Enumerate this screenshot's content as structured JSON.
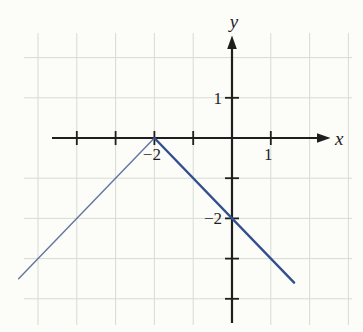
{
  "figure": {
    "background": "#fcfcf9",
    "grid_color": "#d7dcd0",
    "axis_color": "#1e1e1e",
    "label_color": "#1e1e1e",
    "x_axis_label": "x",
    "y_axis_label": "y",
    "x_ticks": [
      {
        "value": -4,
        "label": ""
      },
      {
        "value": -3,
        "label": ""
      },
      {
        "value": -2,
        "label": "−2"
      },
      {
        "value": -1,
        "label": ""
      },
      {
        "value": 1,
        "label": "1"
      }
    ],
    "y_ticks": [
      {
        "value": 1,
        "label": "1"
      },
      {
        "value": -1,
        "label": ""
      },
      {
        "value": -2,
        "label": "−2"
      },
      {
        "value": -3,
        "label": ""
      },
      {
        "value": -4,
        "label": ""
      }
    ],
    "grid_x_lines": [
      -5,
      -4,
      -3,
      -2,
      -1,
      1,
      2,
      3
    ],
    "grid_y_lines": [
      2,
      1,
      -1,
      -2,
      -3,
      -4
    ]
  },
  "chart_data": {
    "type": "line",
    "title": "",
    "xlabel": "x",
    "ylabel": "y",
    "xlim": [
      -4.7,
      2.5
    ],
    "ylim": [
      -4.7,
      2.6
    ],
    "grid": true,
    "legend": false,
    "function": "y = -|x + 2|",
    "vertex": [
      -2,
      0
    ],
    "x_intercept": [
      -2,
      0
    ],
    "y_intercept": [
      0,
      -2
    ],
    "series": [
      {
        "name": "left-branch",
        "slope": 1,
        "color": "#64759f",
        "stroke_width": 1.4,
        "points": [
          [
            -5.5,
            -3.5
          ],
          [
            -2,
            0
          ]
        ]
      },
      {
        "name": "right-branch",
        "slope": -1,
        "color": "#33508e",
        "stroke_width": 2.4,
        "points": [
          [
            -2,
            0
          ],
          [
            1.6,
            -3.6
          ]
        ]
      }
    ]
  }
}
